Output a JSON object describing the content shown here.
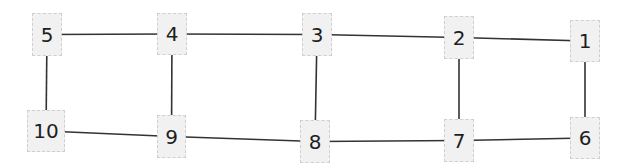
{
  "diagram": {
    "type": "grid-graph",
    "colors": {
      "edge": "#333333",
      "node_fill": "#f1f1f1",
      "node_border": "#cfcfcf",
      "text": "#1e1e1e"
    },
    "nodes": [
      {
        "id": "1",
        "label": "1",
        "x": 570,
        "y": 20,
        "w": 30,
        "h": 42
      },
      {
        "id": "2",
        "label": "2",
        "x": 444,
        "y": 16,
        "w": 30,
        "h": 43
      },
      {
        "id": "3",
        "label": "3",
        "x": 302,
        "y": 13,
        "w": 30,
        "h": 43
      },
      {
        "id": "4",
        "label": "4",
        "x": 157,
        "y": 13,
        "w": 30,
        "h": 42
      },
      {
        "id": "5",
        "label": "5",
        "x": 32,
        "y": 13,
        "w": 30,
        "h": 43
      },
      {
        "id": "6",
        "label": "6",
        "x": 570,
        "y": 117,
        "w": 30,
        "h": 42
      },
      {
        "id": "7",
        "label": "7",
        "x": 444,
        "y": 119,
        "w": 30,
        "h": 43
      },
      {
        "id": "8",
        "label": "8",
        "x": 300,
        "y": 120,
        "w": 30,
        "h": 43
      },
      {
        "id": "9",
        "label": "9",
        "x": 157,
        "y": 115,
        "w": 29,
        "h": 43
      },
      {
        "id": "10",
        "label": "10",
        "x": 27,
        "y": 110,
        "w": 38,
        "h": 42
      }
    ],
    "edges": [
      [
        "5",
        "4"
      ],
      [
        "4",
        "3"
      ],
      [
        "3",
        "2"
      ],
      [
        "2",
        "1"
      ],
      [
        "10",
        "9"
      ],
      [
        "9",
        "8"
      ],
      [
        "8",
        "7"
      ],
      [
        "7",
        "6"
      ],
      [
        "5",
        "10"
      ],
      [
        "4",
        "9"
      ],
      [
        "3",
        "8"
      ],
      [
        "2",
        "7"
      ],
      [
        "1",
        "6"
      ]
    ]
  }
}
